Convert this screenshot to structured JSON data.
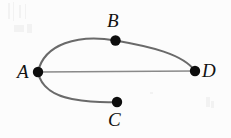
{
  "figure": {
    "width": 231,
    "height": 138,
    "background_color": "#fcfcfc",
    "edge_color": "#6a6a6a",
    "node_color": "#0d0d0d",
    "label_color": "#121212"
  },
  "chart_data": {
    "type": "diagram",
    "diagram_kind": "graph",
    "title": "",
    "nodes": [
      {
        "id": "A",
        "label": "A",
        "x": 38,
        "y": 72,
        "r": 5.2,
        "label_x": 17,
        "label_y": 62,
        "label_anchor": "left"
      },
      {
        "id": "B",
        "label": "B",
        "x": 115.5,
        "y": 40.5,
        "r": 5.2,
        "label_x": 107,
        "label_y": 11,
        "label_anchor": "above"
      },
      {
        "id": "C",
        "label": "C",
        "x": 117,
        "y": 102,
        "r": 5.2,
        "label_x": 108,
        "label_y": 110,
        "label_anchor": "below"
      },
      {
        "id": "D",
        "label": "D",
        "x": 195,
        "y": 71,
        "r": 5.2,
        "label_x": 202,
        "label_y": 61,
        "label_anchor": "right"
      }
    ],
    "edges": [
      {
        "id": "edge-a-b-d",
        "from": "A",
        "to": "D",
        "via": "B",
        "style": "curve",
        "path": "M 38 72 C 44 44, 78 34, 115.5 40.5 C 150 46.5, 183 54, 195 71"
      },
      {
        "id": "edge-a-d",
        "from": "A",
        "to": "D",
        "style": "straight",
        "path": "M 38 72 L 195 71"
      },
      {
        "id": "edge-a-c",
        "from": "A",
        "to": "C",
        "style": "curve",
        "path": "M 38 72 C 41 88, 56 96, 72 99 C 90 102, 106 102.5, 117 102"
      }
    ],
    "xlabel": "",
    "ylabel": "",
    "legend": [],
    "annotations": []
  }
}
